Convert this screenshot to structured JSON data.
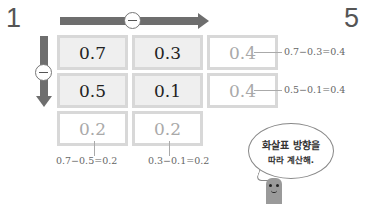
{
  "problem_number": "1",
  "next_problem_number": "5",
  "operations": {
    "horizontal": "minus",
    "vertical": "minus"
  },
  "grid": {
    "rows": [
      [
        {
          "value": "0.7",
          "type": "given"
        },
        {
          "value": "0.3",
          "type": "given"
        },
        {
          "value": "0.4",
          "type": "answer"
        }
      ],
      [
        {
          "value": "0.5",
          "type": "given"
        },
        {
          "value": "0.1",
          "type": "given"
        },
        {
          "value": "0.4",
          "type": "answer"
        }
      ],
      [
        {
          "value": "0.2",
          "type": "answer"
        },
        {
          "value": "0.2",
          "type": "answer"
        }
      ]
    ]
  },
  "calculations": {
    "row1": "0.7−0.3=0.4",
    "row2": "0.5−0.1=0.4",
    "col1": "0.7−0.5=0.2",
    "col2": "0.3−0.1=0.2"
  },
  "speech_bubble": {
    "line1": "화살표 방향을",
    "line2": "따라 계산해."
  },
  "colors": {
    "arrow": "#6e6e6e",
    "given_cell_bg": "#efefef",
    "answer_text": "#a9a9a9",
    "cell_border": "#d8d8d8"
  }
}
